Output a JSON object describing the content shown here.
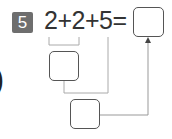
{
  "problem": {
    "number": "5",
    "expression": "2+2+5=",
    "operands": [
      "2",
      "2",
      "5"
    ],
    "operators": [
      "+",
      "+",
      "="
    ],
    "answer_box_value": "",
    "intermediate_box_1_value": "",
    "intermediate_box_2_value": ""
  },
  "edge_fragment": ")",
  "colors": {
    "badge_bg": "#6e6e6e",
    "badge_text": "#ffffff",
    "text": "#333333",
    "box_border": "#555555",
    "connector_line": "#aaaaaa"
  }
}
